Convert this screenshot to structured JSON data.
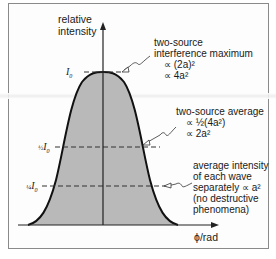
{
  "diagram": {
    "y_axis_label": [
      "relative",
      "intensity"
    ],
    "x_axis_label": "ϕ/rad",
    "levels": [
      {
        "key": "max",
        "label_main": "I",
        "label_sub": "0",
        "label_prefix": "",
        "y_px": 72
      },
      {
        "key": "half",
        "label_main": "I",
        "label_sub": "0",
        "label_prefix": "½",
        "y_px": 147
      },
      {
        "key": "quarter",
        "label_main": "I",
        "label_sub": "0",
        "label_prefix": "¼",
        "y_px": 186
      }
    ],
    "annotations": {
      "maximum": {
        "line1": "two-source",
        "line2": "interference maximum",
        "line3": "∝ (2a)²",
        "line4": "∝ 4a²"
      },
      "average": {
        "line1": "two-source average",
        "line2": "∝ ½(4a²)",
        "line3": "∝ 2a²"
      },
      "single": {
        "line1": "average intensity",
        "line2": "of each wave",
        "line3": "separately ∝ a²",
        "line4": "(no destructive",
        "line5": "phenomena)"
      }
    },
    "colors": {
      "fill": "#b9b9b9",
      "curve": "#111111",
      "axis": "#222222",
      "dash": "#333333",
      "frame": "#8a8a8a"
    }
  }
}
